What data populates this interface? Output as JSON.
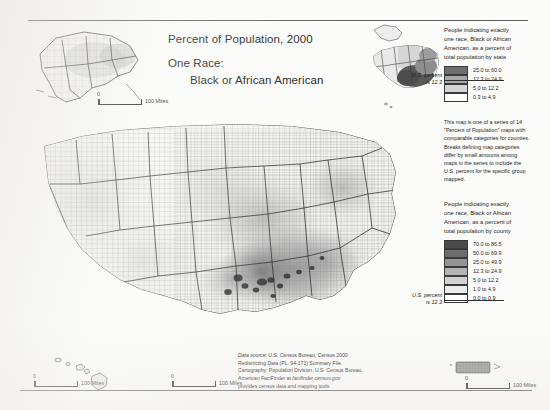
{
  "document": {
    "title_main": "Percent of Population, 2000",
    "title_sub1": "One Race:",
    "title_sub2": "Black or African American"
  },
  "state_legend": {
    "caption": "People indicating exactly one race, Black or African American, as a percent of total population by state",
    "us_percent_line1": "U.S. percent",
    "us_percent_line2": "is 12.3",
    "classes": [
      {
        "label": "25.0 to 60.0",
        "color": "#6f6f6f"
      },
      {
        "label": "12.3 to 24.9",
        "color": "#a8a8a8"
      },
      {
        "label": "5.0 to 12.2",
        "color": "#d4d4d4"
      },
      {
        "label": "0.3 to 4.9",
        "color": "#ffffff"
      }
    ]
  },
  "series_note": "This map is one of a series of 14 \"Percent of Population\" maps with comparable categories for counties. Breaks defining map categories differ by small amounts among maps in the series to include the U.S. percent for the specific group mapped.",
  "county_legend": {
    "caption": "People indicating exactly one race, Black or African American, as a percent of total population by county",
    "us_percent_line1": "U.S. percent",
    "us_percent_line2": "is 12.3",
    "classes": [
      {
        "label": "70.0 to 86.5",
        "color": "#4a4a4a"
      },
      {
        "label": "50.0 to 69.9",
        "color": "#6e6e6e"
      },
      {
        "label": "25.0 to 49.9",
        "color": "#949494"
      },
      {
        "label": "12.3 to 24.9",
        "color": "#b4b4b4"
      },
      {
        "label": "5.0 to 12.2",
        "color": "#d2d2d2"
      },
      {
        "label": "1.0 to 4.9",
        "color": "#ececec"
      },
      {
        "label": "0.0 to 0.9",
        "color": "#ffffff"
      }
    ]
  },
  "source": {
    "line1_label": "Data source:",
    "line1": "U.S. Census Bureau, Census 2000",
    "line2": "Redistricting Data (PL. 94-171) Summary File.",
    "line3": "Cartography: Population Division, U.S. Census Bureau.",
    "line4_pre": "American FactFinder at ",
    "line4_url": "factfinder.census.gov",
    "line5": "provides census data and mapping tools."
  },
  "scalebars": {
    "main": {
      "zero": "0",
      "label": "100 Miles"
    },
    "alaska": {
      "zero": "0",
      "label": "100 Miles"
    },
    "hawaii": {
      "zero": "0",
      "label": "100 Miles"
    },
    "puerto_rico": {
      "zero": "0",
      "label": "100 Miles"
    }
  }
}
